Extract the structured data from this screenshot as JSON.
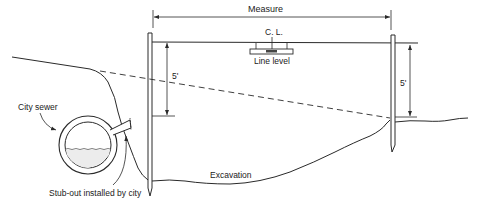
{
  "diagram": {
    "labels": {
      "measure": "Measure",
      "center_line": "C. L.",
      "line_level": "Line level",
      "left_depth": "5'",
      "right_depth": "5'",
      "city_sewer": "City sewer",
      "stub_out": "Stub-out installed by city",
      "excavation": "Excavation"
    },
    "colors": {
      "line": "#2a2a2a",
      "background": "#ffffff"
    }
  }
}
